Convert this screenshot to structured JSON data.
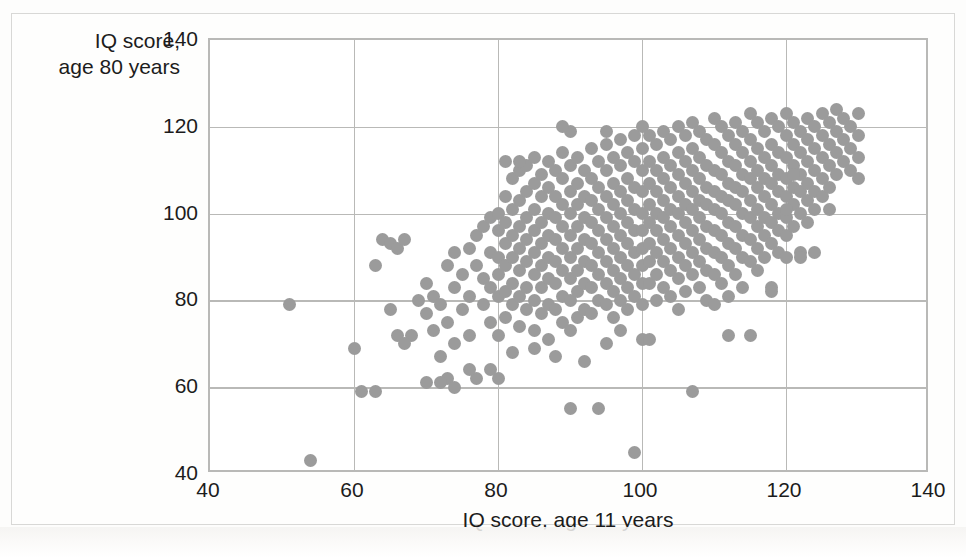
{
  "chart_data": {
    "type": "scatter",
    "title": "",
    "xlabel": "IQ score, age 11 years",
    "ylabel_line1": "IQ score,",
    "ylabel_line2": "age 80 years",
    "xlim": [
      40,
      140
    ],
    "ylim": [
      40,
      140
    ],
    "xticks": [
      40,
      60,
      80,
      100,
      120,
      140
    ],
    "yticks": [
      40,
      60,
      80,
      100,
      120,
      140
    ],
    "grid": true,
    "legend": "none",
    "marker_color": "#9b9b9b",
    "marker_size_px": 13,
    "n_points": 417,
    "points": [
      [
        51,
        79
      ],
      [
        54,
        43
      ],
      [
        60,
        69
      ],
      [
        61,
        59
      ],
      [
        63,
        59
      ],
      [
        63,
        88
      ],
      [
        64,
        94
      ],
      [
        65,
        93
      ],
      [
        65,
        78
      ],
      [
        66,
        92
      ],
      [
        66,
        72
      ],
      [
        67,
        94
      ],
      [
        68,
        72
      ],
      [
        69,
        80
      ],
      [
        70,
        77
      ],
      [
        70,
        84
      ],
      [
        71,
        73
      ],
      [
        71,
        81
      ],
      [
        72,
        79
      ],
      [
        72,
        67
      ],
      [
        73,
        88
      ],
      [
        73,
        75
      ],
      [
        73,
        62
      ],
      [
        74,
        83
      ],
      [
        74,
        91
      ],
      [
        74,
        70
      ],
      [
        75,
        86
      ],
      [
        75,
        78
      ],
      [
        76,
        92
      ],
      [
        76,
        81
      ],
      [
        76,
        72
      ],
      [
        77,
        95
      ],
      [
        77,
        88
      ],
      [
        77,
        62
      ],
      [
        78,
        97
      ],
      [
        78,
        85
      ],
      [
        78,
        79
      ],
      [
        79,
        99
      ],
      [
        79,
        91
      ],
      [
        79,
        83
      ],
      [
        79,
        75
      ],
      [
        80,
        100
      ],
      [
        80,
        96
      ],
      [
        80,
        90
      ],
      [
        80,
        86
      ],
      [
        80,
        81
      ],
      [
        80,
        72
      ],
      [
        80,
        62
      ],
      [
        81,
        112
      ],
      [
        81,
        104
      ],
      [
        81,
        98
      ],
      [
        81,
        93
      ],
      [
        81,
        88
      ],
      [
        81,
        82
      ],
      [
        81,
        76
      ],
      [
        82,
        108
      ],
      [
        82,
        101
      ],
      [
        82,
        95
      ],
      [
        82,
        90
      ],
      [
        82,
        84
      ],
      [
        82,
        79
      ],
      [
        83,
        110
      ],
      [
        83,
        103
      ],
      [
        83,
        97
      ],
      [
        83,
        92
      ],
      [
        83,
        87
      ],
      [
        83,
        81
      ],
      [
        83,
        74
      ],
      [
        84,
        111
      ],
      [
        84,
        105
      ],
      [
        84,
        99
      ],
      [
        84,
        94
      ],
      [
        84,
        89
      ],
      [
        84,
        83
      ],
      [
        84,
        78
      ],
      [
        85,
        113
      ],
      [
        85,
        107
      ],
      [
        85,
        101
      ],
      [
        85,
        96
      ],
      [
        85,
        91
      ],
      [
        85,
        86
      ],
      [
        85,
        80
      ],
      [
        85,
        73
      ],
      [
        86,
        109
      ],
      [
        86,
        104
      ],
      [
        86,
        98
      ],
      [
        86,
        93
      ],
      [
        86,
        88
      ],
      [
        86,
        83
      ],
      [
        86,
        77
      ],
      [
        87,
        112
      ],
      [
        87,
        106
      ],
      [
        87,
        100
      ],
      [
        87,
        95
      ],
      [
        87,
        90
      ],
      [
        87,
        85
      ],
      [
        87,
        79
      ],
      [
        87,
        71
      ],
      [
        88,
        110
      ],
      [
        88,
        104
      ],
      [
        88,
        99
      ],
      [
        88,
        94
      ],
      [
        88,
        89
      ],
      [
        88,
        84
      ],
      [
        88,
        78
      ],
      [
        89,
        114
      ],
      [
        89,
        108
      ],
      [
        89,
        102
      ],
      [
        89,
        97
      ],
      [
        89,
        92
      ],
      [
        89,
        87
      ],
      [
        89,
        81
      ],
      [
        89,
        75
      ],
      [
        90,
        119
      ],
      [
        90,
        111
      ],
      [
        90,
        105
      ],
      [
        90,
        100
      ],
      [
        90,
        95
      ],
      [
        90,
        90
      ],
      [
        90,
        85
      ],
      [
        90,
        80
      ],
      [
        90,
        73
      ],
      [
        90,
        55
      ],
      [
        91,
        113
      ],
      [
        91,
        107
      ],
      [
        91,
        102
      ],
      [
        91,
        97
      ],
      [
        91,
        92
      ],
      [
        91,
        87
      ],
      [
        91,
        82
      ],
      [
        91,
        76
      ],
      [
        92,
        110
      ],
      [
        92,
        104
      ],
      [
        92,
        99
      ],
      [
        92,
        94
      ],
      [
        92,
        89
      ],
      [
        92,
        84
      ],
      [
        92,
        78
      ],
      [
        93,
        115
      ],
      [
        93,
        108
      ],
      [
        93,
        103
      ],
      [
        93,
        98
      ],
      [
        93,
        93
      ],
      [
        93,
        88
      ],
      [
        93,
        83
      ],
      [
        93,
        77
      ],
      [
        94,
        112
      ],
      [
        94,
        106
      ],
      [
        94,
        101
      ],
      [
        94,
        96
      ],
      [
        94,
        91
      ],
      [
        94,
        86
      ],
      [
        94,
        80
      ],
      [
        94,
        55
      ],
      [
        95,
        116
      ],
      [
        95,
        110
      ],
      [
        95,
        104
      ],
      [
        95,
        99
      ],
      [
        95,
        94
      ],
      [
        95,
        89
      ],
      [
        95,
        84
      ],
      [
        95,
        79
      ],
      [
        95,
        70
      ],
      [
        96,
        113
      ],
      [
        96,
        107
      ],
      [
        96,
        102
      ],
      [
        96,
        97
      ],
      [
        96,
        92
      ],
      [
        96,
        87
      ],
      [
        96,
        82
      ],
      [
        96,
        76
      ],
      [
        97,
        117
      ],
      [
        97,
        111
      ],
      [
        97,
        105
      ],
      [
        97,
        100
      ],
      [
        97,
        95
      ],
      [
        97,
        90
      ],
      [
        97,
        85
      ],
      [
        97,
        80
      ],
      [
        97,
        73
      ],
      [
        98,
        114
      ],
      [
        98,
        108
      ],
      [
        98,
        103
      ],
      [
        98,
        98
      ],
      [
        98,
        93
      ],
      [
        98,
        88
      ],
      [
        98,
        83
      ],
      [
        98,
        78
      ],
      [
        99,
        118
      ],
      [
        99,
        112
      ],
      [
        99,
        106
      ],
      [
        99,
        101
      ],
      [
        99,
        96
      ],
      [
        99,
        91
      ],
      [
        99,
        86
      ],
      [
        99,
        81
      ],
      [
        99,
        45
      ],
      [
        100,
        120
      ],
      [
        100,
        115
      ],
      [
        100,
        110
      ],
      [
        100,
        105
      ],
      [
        100,
        100
      ],
      [
        100,
        96
      ],
      [
        100,
        92
      ],
      [
        100,
        88
      ],
      [
        100,
        84
      ],
      [
        100,
        79
      ],
      [
        100,
        71
      ],
      [
        101,
        118
      ],
      [
        101,
        112
      ],
      [
        101,
        107
      ],
      [
        101,
        102
      ],
      [
        101,
        98
      ],
      [
        101,
        93
      ],
      [
        101,
        89
      ],
      [
        101,
        84
      ],
      [
        102,
        116
      ],
      [
        102,
        110
      ],
      [
        102,
        105
      ],
      [
        102,
        100
      ],
      [
        102,
        96
      ],
      [
        102,
        91
      ],
      [
        102,
        86
      ],
      [
        102,
        80
      ],
      [
        103,
        119
      ],
      [
        103,
        113
      ],
      [
        103,
        108
      ],
      [
        103,
        103
      ],
      [
        103,
        99
      ],
      [
        103,
        94
      ],
      [
        103,
        89
      ],
      [
        103,
        83
      ],
      [
        104,
        117
      ],
      [
        104,
        111
      ],
      [
        104,
        106
      ],
      [
        104,
        101
      ],
      [
        104,
        97
      ],
      [
        104,
        92
      ],
      [
        104,
        87
      ],
      [
        104,
        81
      ],
      [
        105,
        120
      ],
      [
        105,
        114
      ],
      [
        105,
        109
      ],
      [
        105,
        104
      ],
      [
        105,
        100
      ],
      [
        105,
        95
      ],
      [
        105,
        90
      ],
      [
        105,
        85
      ],
      [
        105,
        78
      ],
      [
        106,
        118
      ],
      [
        106,
        112
      ],
      [
        106,
        107
      ],
      [
        106,
        102
      ],
      [
        106,
        98
      ],
      [
        106,
        93
      ],
      [
        106,
        88
      ],
      [
        106,
        82
      ],
      [
        107,
        121
      ],
      [
        107,
        115
      ],
      [
        107,
        110
      ],
      [
        107,
        105
      ],
      [
        107,
        101
      ],
      [
        107,
        96
      ],
      [
        107,
        91
      ],
      [
        107,
        86
      ],
      [
        107,
        59
      ],
      [
        108,
        119
      ],
      [
        108,
        113
      ],
      [
        108,
        108
      ],
      [
        108,
        103
      ],
      [
        108,
        99
      ],
      [
        108,
        94
      ],
      [
        108,
        89
      ],
      [
        108,
        83
      ],
      [
        109,
        117
      ],
      [
        109,
        111
      ],
      [
        109,
        106
      ],
      [
        109,
        102
      ],
      [
        109,
        97
      ],
      [
        109,
        92
      ],
      [
        109,
        87
      ],
      [
        109,
        80
      ],
      [
        110,
        122
      ],
      [
        110,
        116
      ],
      [
        110,
        110
      ],
      [
        110,
        105
      ],
      [
        110,
        101
      ],
      [
        110,
        96
      ],
      [
        110,
        91
      ],
      [
        110,
        86
      ],
      [
        110,
        79
      ],
      [
        111,
        120
      ],
      [
        111,
        114
      ],
      [
        111,
        109
      ],
      [
        111,
        104
      ],
      [
        111,
        100
      ],
      [
        111,
        95
      ],
      [
        111,
        90
      ],
      [
        111,
        84
      ],
      [
        112,
        118
      ],
      [
        112,
        112
      ],
      [
        112,
        107
      ],
      [
        112,
        103
      ],
      [
        112,
        98
      ],
      [
        112,
        93
      ],
      [
        112,
        88
      ],
      [
        112,
        81
      ],
      [
        113,
        121
      ],
      [
        113,
        116
      ],
      [
        113,
        111
      ],
      [
        113,
        106
      ],
      [
        113,
        102
      ],
      [
        113,
        97
      ],
      [
        113,
        92
      ],
      [
        113,
        86
      ],
      [
        114,
        119
      ],
      [
        114,
        114
      ],
      [
        114,
        109
      ],
      [
        114,
        105
      ],
      [
        114,
        100
      ],
      [
        114,
        95
      ],
      [
        114,
        90
      ],
      [
        114,
        83
      ],
      [
        115,
        123
      ],
      [
        115,
        117
      ],
      [
        115,
        112
      ],
      [
        115,
        108
      ],
      [
        115,
        103
      ],
      [
        115,
        99
      ],
      [
        115,
        94
      ],
      [
        115,
        89
      ],
      [
        115,
        72
      ],
      [
        116,
        121
      ],
      [
        116,
        115
      ],
      [
        116,
        110
      ],
      [
        116,
        106
      ],
      [
        116,
        101
      ],
      [
        116,
        97
      ],
      [
        116,
        92
      ],
      [
        116,
        87
      ],
      [
        117,
        119
      ],
      [
        117,
        113
      ],
      [
        117,
        108
      ],
      [
        117,
        104
      ],
      [
        117,
        99
      ],
      [
        117,
        95
      ],
      [
        117,
        90
      ],
      [
        118,
        122
      ],
      [
        118,
        116
      ],
      [
        118,
        111
      ],
      [
        118,
        107
      ],
      [
        118,
        102
      ],
      [
        118,
        98
      ],
      [
        118,
        93
      ],
      [
        118,
        83
      ],
      [
        119,
        120
      ],
      [
        119,
        114
      ],
      [
        119,
        109
      ],
      [
        119,
        105
      ],
      [
        119,
        100
      ],
      [
        119,
        96
      ],
      [
        119,
        91
      ],
      [
        120,
        123
      ],
      [
        120,
        118
      ],
      [
        120,
        113
      ],
      [
        120,
        108
      ],
      [
        120,
        104
      ],
      [
        120,
        99
      ],
      [
        120,
        95
      ],
      [
        120,
        90
      ],
      [
        121,
        121
      ],
      [
        121,
        116
      ],
      [
        121,
        111
      ],
      [
        121,
        106
      ],
      [
        121,
        102
      ],
      [
        121,
        97
      ],
      [
        122,
        119
      ],
      [
        122,
        114
      ],
      [
        122,
        109
      ],
      [
        122,
        105
      ],
      [
        122,
        100
      ],
      [
        122,
        91
      ],
      [
        123,
        122
      ],
      [
        123,
        117
      ],
      [
        123,
        112
      ],
      [
        123,
        107
      ],
      [
        123,
        103
      ],
      [
        123,
        98
      ],
      [
        124,
        120
      ],
      [
        124,
        115
      ],
      [
        124,
        110
      ],
      [
        124,
        105
      ],
      [
        124,
        101
      ],
      [
        125,
        123
      ],
      [
        125,
        118
      ],
      [
        125,
        113
      ],
      [
        125,
        108
      ],
      [
        125,
        104
      ],
      [
        126,
        121
      ],
      [
        126,
        116
      ],
      [
        126,
        111
      ],
      [
        126,
        106
      ],
      [
        127,
        124
      ],
      [
        127,
        119
      ],
      [
        127,
        114
      ],
      [
        127,
        109
      ],
      [
        128,
        122
      ],
      [
        128,
        117
      ],
      [
        128,
        112
      ],
      [
        129,
        120
      ],
      [
        129,
        115
      ],
      [
        129,
        110
      ],
      [
        130,
        123
      ],
      [
        130,
        118
      ],
      [
        130,
        113
      ],
      [
        130,
        108
      ],
      [
        122,
        90
      ],
      [
        124,
        91
      ],
      [
        120,
        101
      ],
      [
        126,
        101
      ],
      [
        121,
        109
      ],
      [
        118,
        82
      ],
      [
        112,
        72
      ],
      [
        101,
        71
      ],
      [
        88,
        67
      ],
      [
        92,
        66
      ],
      [
        85,
        69
      ],
      [
        82,
        68
      ],
      [
        79,
        64
      ],
      [
        76,
        64
      ],
      [
        74,
        60
      ],
      [
        72,
        61
      ],
      [
        70,
        61
      ],
      [
        67,
        70
      ],
      [
        89,
        120
      ],
      [
        95,
        119
      ],
      [
        83,
        112
      ]
    ]
  }
}
